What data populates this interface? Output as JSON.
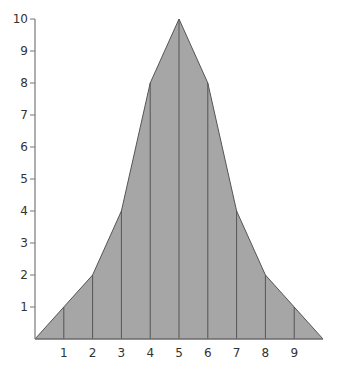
{
  "chart_data": {
    "type": "area",
    "title": "",
    "xlabel": "",
    "ylabel": "",
    "x": [
      0,
      1,
      2,
      3,
      4,
      5,
      6,
      7,
      8,
      9,
      10
    ],
    "values": [
      0,
      1,
      2,
      4,
      8,
      10,
      8,
      4,
      2,
      1,
      0
    ],
    "x_tick_labels": [
      "1",
      "2",
      "3",
      "4",
      "5",
      "6",
      "7",
      "8",
      "9"
    ],
    "y_tick_labels": [
      "1",
      "2",
      "3",
      "4",
      "5",
      "6",
      "7",
      "8",
      "9",
      "10"
    ],
    "xlim": [
      0,
      10
    ],
    "ylim": [
      0,
      10
    ],
    "grid": false,
    "legend": null,
    "vertical_lines_at": [
      1,
      2,
      3,
      4,
      5,
      6,
      7,
      8,
      9
    ],
    "fill_color": "#a6a6a6",
    "line_color": "#555555"
  }
}
